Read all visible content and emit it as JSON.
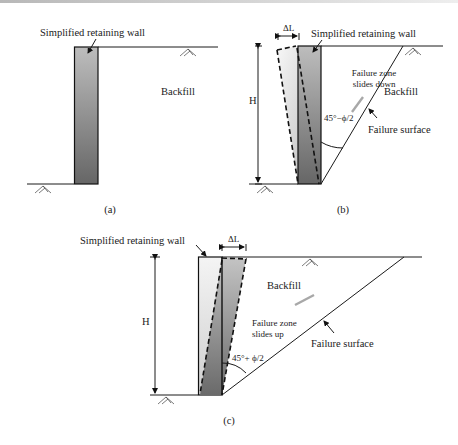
{
  "figure": {
    "panels": [
      {
        "id": "a",
        "caption": "(a)",
        "labels": {
          "wall": "Simplified retaining wall",
          "backfill": "Backfill"
        }
      },
      {
        "id": "b",
        "caption": "(b)",
        "labels": {
          "wall": "Simplified retaining wall",
          "backfill": "Backfill",
          "displacement": "ΔL",
          "height": "H",
          "zone_line1": "Failure zone",
          "zone_line2": "slides down",
          "angle": "45°−ϕ/2",
          "surface": "Failure surface"
        }
      },
      {
        "id": "c",
        "caption": "(c)",
        "labels": {
          "wall": "Simplified retaining wall",
          "backfill": "Backfill",
          "displacement": "ΔL",
          "height": "H",
          "zone_line1": "Failure zone",
          "zone_line2": "slides up",
          "angle": "45°+ ϕ/2",
          "surface": "Failure surface"
        }
      }
    ],
    "colors": {
      "wall_dark": "#6e6e6e",
      "wall_light": "#bdbdbd",
      "ghost_light": "#f2f2f2",
      "ghost_dark": "#c4c4c4",
      "slide_arrow": "#a8a8a8",
      "line": "#1a1a1a"
    }
  }
}
